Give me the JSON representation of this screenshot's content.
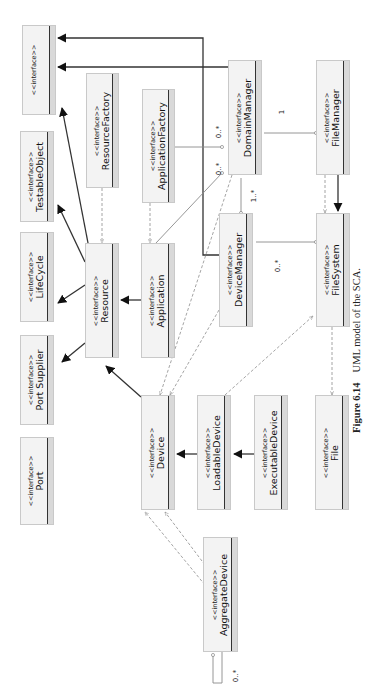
{
  "figure": {
    "number": "Figure 6.14",
    "caption": "UML model of the SCA.",
    "orientation": "rotated -90deg"
  },
  "stereotype": "<<interface>>",
  "boxes": [
    {
      "id": "top-interface",
      "name": "",
      "x": 22,
      "y": 25,
      "w": 34,
      "h": 90
    },
    {
      "id": "testable-object",
      "name": "TestableObject",
      "x": 20,
      "y": 131,
      "w": 34,
      "h": 91
    },
    {
      "id": "lifecycle",
      "name": "LifeCycle",
      "x": 20,
      "y": 232,
      "w": 34,
      "h": 90
    },
    {
      "id": "port-supplier",
      "name": "Port Supplier",
      "x": 20,
      "y": 335,
      "w": 34,
      "h": 90
    },
    {
      "id": "port",
      "name": "Port",
      "x": 20,
      "y": 437,
      "w": 34,
      "h": 88
    },
    {
      "id": "resource-factory",
      "name": "ResourceFactory",
      "x": 86,
      "y": 73,
      "w": 33,
      "h": 115
    },
    {
      "id": "resource",
      "name": "Resource",
      "x": 85,
      "y": 243,
      "w": 34,
      "h": 115
    },
    {
      "id": "application-factory",
      "name": "ApplicationFactory",
      "x": 142,
      "y": 89,
      "w": 33,
      "h": 114
    },
    {
      "id": "application",
      "name": "Application",
      "x": 141,
      "y": 243,
      "w": 34,
      "h": 115
    },
    {
      "id": "device",
      "name": "Device",
      "x": 141,
      "y": 395,
      "w": 34,
      "h": 115
    },
    {
      "id": "loadable-device",
      "name": "LoadableDevice",
      "x": 197,
      "y": 395,
      "w": 34,
      "h": 115
    },
    {
      "id": "executable-device",
      "name": "ExecutableDevice",
      "x": 254,
      "y": 395,
      "w": 34,
      "h": 115
    },
    {
      "id": "file",
      "name": "File",
      "x": 315,
      "y": 395,
      "w": 34,
      "h": 115
    },
    {
      "id": "domain-manager",
      "name": "DomainManager",
      "x": 228,
      "y": 60,
      "w": 34,
      "h": 115
    },
    {
      "id": "device-manager",
      "name": "DeviceManager",
      "x": 219,
      "y": 213,
      "w": 34,
      "h": 114
    },
    {
      "id": "file-manager",
      "name": "FileManager",
      "x": 316,
      "y": 60,
      "w": 34,
      "h": 115
    },
    {
      "id": "file-system",
      "name": "FileSystem",
      "x": 316,
      "y": 213,
      "w": 34,
      "h": 114
    },
    {
      "id": "aggregate-device",
      "name": "AggregateDevice",
      "x": 203,
      "y": 537,
      "w": 35,
      "h": 115
    }
  ],
  "multiplicities": [
    {
      "id": "dm-appfactory-mult",
      "text": "0..*",
      "x": 213,
      "y": 128
    },
    {
      "id": "dm-app-mult",
      "text": "0..*",
      "x": 213,
      "y": 165
    },
    {
      "id": "dm-fm-mult",
      "text": "1",
      "x": 280,
      "y": 108
    },
    {
      "id": "dm-devmgr-mult",
      "text": "1..*",
      "x": 248,
      "y": 192
    },
    {
      "id": "devmgr-fs-mult",
      "text": "0..*",
      "x": 272,
      "y": 262
    },
    {
      "id": "aggregate-self-mult",
      "text": "0..*",
      "x": 230,
      "y": 672
    }
  ],
  "relations": {
    "generalizations": [
      {
        "from": "domain-manager",
        "to": "top-interface",
        "points": [
          [
            228,
            67
          ],
          [
            58,
            67
          ]
        ]
      },
      {
        "from": "device-manager",
        "to": "top-interface",
        "points": [
          [
            219,
            255
          ],
          [
            203,
            255
          ],
          [
            203,
            38
          ],
          [
            58,
            38
          ]
        ]
      },
      {
        "from": "resource",
        "to": "top-interface",
        "points": [
          [
            88,
            243
          ],
          [
            62,
            108
          ]
        ]
      },
      {
        "from": "resource",
        "to": "testable-object",
        "points": [
          [
            85,
            262
          ],
          [
            58,
            205
          ]
        ]
      },
      {
        "from": "resource",
        "to": "lifecycle",
        "points": [
          [
            85,
            285
          ],
          [
            58,
            303
          ]
        ]
      },
      {
        "from": "resource",
        "to": "port-supplier",
        "points": [
          [
            85,
            343
          ],
          [
            62,
            362
          ]
        ]
      },
      {
        "from": "application",
        "to": "resource",
        "points": [
          [
            141,
            300
          ],
          [
            121,
            300
          ]
        ]
      },
      {
        "from": "device",
        "to": "resource",
        "points": [
          [
            141,
            397
          ],
          [
            106,
            366
          ]
        ]
      },
      {
        "from": "loadable-device",
        "to": "device",
        "points": [
          [
            197,
            454
          ],
          [
            177,
            454
          ]
        ]
      },
      {
        "from": "executable-device",
        "to": "loadable-device",
        "points": [
          [
            254,
            454
          ],
          [
            234,
            454
          ]
        ]
      },
      {
        "from": "file-manager",
        "to": "file-system",
        "points": [
          [
            338,
            175
          ],
          [
            338,
            211
          ]
        ]
      }
    ],
    "associations": [
      {
        "from": "application-factory",
        "to": "domain-manager",
        "points": [
          [
            175,
            147
          ],
          [
            222,
            147
          ]
        ]
      },
      {
        "from": "application",
        "to": "domain-manager",
        "points": [
          [
            156,
            243
          ],
          [
            222,
            173
          ]
        ]
      },
      {
        "from": "domain-manager",
        "to": "file-manager",
        "points": [
          [
            264,
            133
          ],
          [
            316,
            133
          ]
        ]
      },
      {
        "from": "domain-manager",
        "to": "device-manager",
        "points": [
          [
            241,
            178
          ],
          [
            241,
            213
          ]
        ]
      },
      {
        "from": "device-manager",
        "to": "file-system",
        "points": [
          [
            256,
            242
          ],
          [
            316,
            242
          ]
        ]
      },
      {
        "from": "aggregate-device",
        "to": "aggregate-device",
        "points": [
          [
            222,
            652
          ],
          [
            222,
            683
          ],
          [
            213,
            683
          ],
          [
            213,
            655
          ]
        ]
      }
    ],
    "dependencies": [
      {
        "from": "resource-factory",
        "to": "resource",
        "points": [
          [
            102,
            188
          ],
          [
            102,
            243
          ]
        ]
      },
      {
        "from": "application-factory",
        "to": "application",
        "points": [
          [
            150,
            203
          ],
          [
            150,
            243
          ]
        ]
      },
      {
        "from": "domain-manager",
        "to": "device",
        "points": [
          [
            232,
            175
          ],
          [
            160,
            395
          ]
        ]
      },
      {
        "from": "device-manager",
        "to": "device",
        "points": [
          [
            219,
            310
          ],
          [
            170,
            395
          ]
        ]
      },
      {
        "from": "file-manager",
        "to": "file-system",
        "points": [
          [
            325,
            175
          ],
          [
            325,
            213
          ]
        ]
      },
      {
        "from": "loadable-device",
        "to": "file-system",
        "points": [
          [
            225,
            395
          ],
          [
            313,
            316
          ]
        ]
      },
      {
        "from": "file-system",
        "to": "file",
        "points": [
          [
            332,
            327
          ],
          [
            332,
            395
          ]
        ]
      },
      {
        "from": "aggregate-device",
        "to": "device",
        "points": [
          [
            205,
            585
          ],
          [
            145,
            512
          ]
        ]
      },
      {
        "from": "aggregate-device",
        "to": "device",
        "points": [
          [
            205,
            565
          ],
          [
            165,
            512
          ]
        ]
      }
    ]
  },
  "colors": {
    "box_fill": "#f3f3f3",
    "box_strip": "#d9d9d9",
    "line_solid": "#333333",
    "line_dashed": "#9a9a9a",
    "line_assoc": "#8a8a8a"
  }
}
